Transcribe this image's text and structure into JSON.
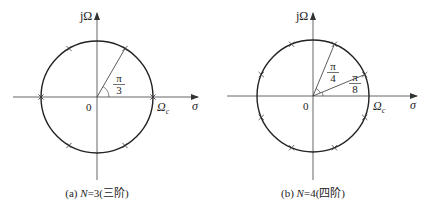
{
  "panels": [
    {
      "id": "a",
      "order_N": 3,
      "caption_prefix": "(a) ",
      "caption_N": "N",
      "caption_rest": "=3(三阶)",
      "y_axis_label": "jΩ",
      "x_axis_label": "σ",
      "origin_label": "0",
      "cutoff_label": "Ω",
      "cutoff_subscript": "c",
      "pole_angles_deg": [
        0,
        60,
        120,
        180,
        240,
        300
      ],
      "rays_deg": [
        60
      ],
      "angle_labels": [
        {
          "num": "π",
          "den": "3"
        }
      ]
    },
    {
      "id": "b",
      "order_N": 4,
      "caption_prefix": "(b) ",
      "caption_N": "N",
      "caption_rest": "=4(四阶)",
      "y_axis_label": "jΩ",
      "x_axis_label": "σ",
      "origin_label": "0",
      "cutoff_label": "Ω",
      "cutoff_subscript": "c",
      "pole_angles_deg": [
        22.5,
        67.5,
        112.5,
        157.5,
        202.5,
        247.5,
        292.5,
        337.5
      ],
      "rays_deg": [
        67.5,
        22.5
      ],
      "angle_labels": [
        {
          "num": "π",
          "den": "4"
        },
        {
          "num": "π",
          "den": "8"
        }
      ]
    }
  ]
}
